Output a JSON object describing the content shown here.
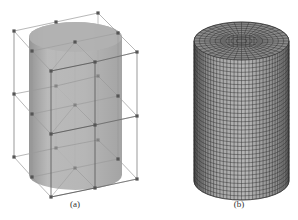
{
  "figure": {
    "panels": [
      {
        "id": "a",
        "label": "(a)",
        "description": "Cylinder with enclosing control lattice (27 control points, 3 layers)",
        "cylinder": {
          "cx": 75.5,
          "rx": 46.5,
          "ry": 15,
          "top_cy": 37,
          "bottom_cy": 175
        },
        "layers": [
          {
            "name": "top",
            "nodes": {
              "A": [
                14,
                31
              ],
              "B": [
                56,
                22
              ],
              "C": [
                98,
                13
              ],
              "D": [
                118,
                33
              ],
              "E": [
                137,
                52
              ],
              "F": [
                75,
                42
              ],
              "G": [
                32,
                51
              ],
              "H": [
                51,
                71
              ],
              "I": [
                95,
                62
              ]
            }
          },
          {
            "name": "middle",
            "nodes": {
              "A": [
                14,
                94
              ],
              "B": [
                56,
                86
              ],
              "C": [
                98,
                76
              ],
              "D": [
                118,
                96
              ],
              "E": [
                137,
                116
              ],
              "F": [
                75,
                105
              ],
              "G": [
                32,
                114
              ],
              "H": [
                51,
                134
              ],
              "I": [
                95,
                125
              ]
            }
          },
          {
            "name": "bottom",
            "nodes": {
              "A": [
                14,
                157
              ],
              "B": [
                56,
                148
              ],
              "C": [
                98,
                140
              ],
              "D": [
                118,
                159
              ],
              "E": [
                137,
                179
              ],
              "F": [
                75,
                168
              ],
              "G": [
                32,
                177
              ],
              "H": [
                51,
                197
              ],
              "I": [
                95,
                188
              ]
            }
          }
        ]
      },
      {
        "id": "b",
        "label": "(b)",
        "description": "Meshed cylinder (hexahedral surface grid)",
        "cylinder": {
          "cx": 241.5,
          "rx": 47.5,
          "ry": 19,
          "top_cy": 41,
          "bottom_cy": 181
        },
        "mesh": {
          "vertical_divisions": 40,
          "horizontal_divisions": 34,
          "top_rings": 9
        }
      }
    ],
    "colors": {
      "cylinder_fill_a": "#a9a9a9",
      "cylinder_fill_b": "#8e8e8e",
      "lattice_line": "#9a9a9a",
      "lattice_line_dark": "#555555",
      "node": "#555555",
      "mesh_line": "#2a2a2a"
    }
  }
}
